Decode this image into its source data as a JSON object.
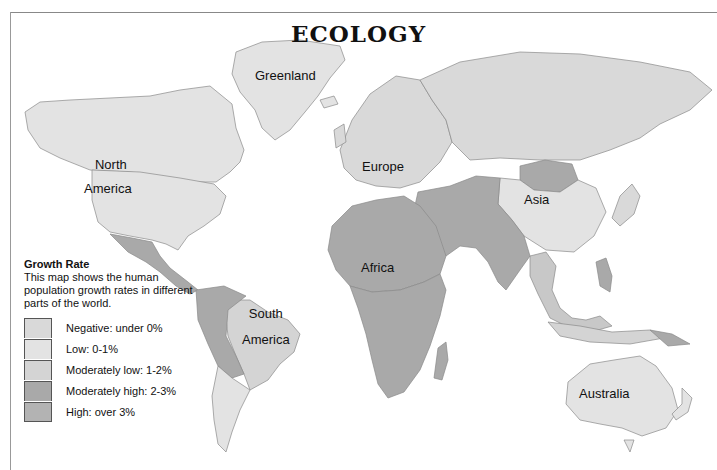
{
  "title": "ECOLOGY",
  "map_labels": {
    "greenland": "Greenland",
    "north_america": [
      "North",
      "America"
    ],
    "europe": "Europe",
    "asia": "Asia",
    "africa": "Africa",
    "south_america": [
      "South",
      "America"
    ],
    "australia": "Australia"
  },
  "legend": {
    "title": "Growth Rate",
    "description": "This map shows the human population growth rates in different parts of the world.",
    "items": [
      {
        "label": "Negative: under 0%",
        "color": "#d9d9d9"
      },
      {
        "label": "Low: 0-1%",
        "color": "#e3e3e3"
      },
      {
        "label": "Moderately low: 1-2%",
        "color": "#d4d4d4"
      },
      {
        "label": "Moderately high: 2-3%",
        "color": "#a9a9a9"
      },
      {
        "label": "High: over 3%",
        "color": "#b3b3b3"
      }
    ]
  },
  "colors": {
    "ocean": "#ffffff",
    "border": "#8a8a8a"
  }
}
